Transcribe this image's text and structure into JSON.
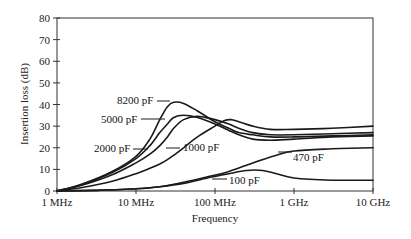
{
  "chart_data": {
    "type": "line",
    "title": "",
    "xlabel": "Frequency",
    "ylabel": "Insertion loss (dB)",
    "xscale": "log",
    "xlim_mhz": [
      1,
      10000
    ],
    "ylim": [
      0,
      80
    ],
    "grid": false,
    "legend": "inline labels with leader lines",
    "x_ticks": [
      {
        "value_mhz": 1,
        "label": "1 MHz"
      },
      {
        "value_mhz": 10,
        "label": "10 MHz"
      },
      {
        "value_mhz": 100,
        "label": "100 MHz"
      },
      {
        "value_mhz": 1000,
        "label": "1 GHz"
      },
      {
        "value_mhz": 10000,
        "label": "10 GHz"
      }
    ],
    "y_ticks": [
      0,
      10,
      20,
      30,
      40,
      50,
      60,
      70,
      80
    ],
    "series": [
      {
        "name": "8200 pF",
        "x_mhz": [
          1,
          2,
          5,
          10,
          15,
          20,
          25,
          30,
          40,
          60,
          100,
          150,
          200,
          300,
          500,
          1000,
          3000,
          10000
        ],
        "values": [
          0,
          3,
          9,
          16,
          24,
          33,
          39,
          41,
          40.5,
          37,
          32,
          29,
          27,
          26,
          25,
          25,
          25.5,
          26
        ]
      },
      {
        "name": "5000 pF",
        "x_mhz": [
          1,
          2,
          5,
          10,
          15,
          20,
          25,
          30,
          40,
          60,
          100,
          150,
          200,
          300,
          500,
          1000,
          3000,
          10000
        ],
        "values": [
          0,
          2.8,
          8.5,
          15,
          21,
          27,
          31,
          34,
          35,
          34,
          31,
          28,
          26,
          24,
          23.5,
          24,
          25,
          25.5
        ]
      },
      {
        "name": "2000 pF",
        "x_mhz": [
          1,
          2,
          5,
          10,
          15,
          20,
          25,
          30,
          40,
          60,
          100,
          150,
          200,
          300,
          500,
          1000,
          3000,
          10000
        ],
        "values": [
          0,
          2.5,
          7.5,
          13,
          17,
          21,
          25,
          29,
          33,
          34.5,
          33,
          31,
          29,
          27,
          26,
          26,
          26.5,
          27
        ]
      },
      {
        "name": "1000 pF",
        "x_mhz": [
          1,
          2,
          5,
          10,
          15,
          20,
          25,
          30,
          40,
          60,
          100,
          130,
          160,
          200,
          300,
          500,
          1000,
          3000,
          10000
        ],
        "values": [
          0,
          1.5,
          4.5,
          8,
          10.5,
          12.5,
          14.5,
          16.5,
          20,
          25,
          30,
          32.5,
          33,
          32,
          30,
          28.5,
          28.5,
          29,
          30
        ]
      },
      {
        "name": "470 pF",
        "x_mhz": [
          1,
          3,
          10,
          20,
          40,
          80,
          150,
          300,
          600,
          1000,
          3000,
          10000
        ],
        "values": [
          0,
          0.3,
          1,
          2,
          4,
          6.5,
          9,
          13,
          16.5,
          18.5,
          19.5,
          20
        ]
      },
      {
        "name": "100 pF",
        "x_mhz": [
          1,
          3,
          10,
          20,
          40,
          80,
          150,
          250,
          400,
          600,
          1000,
          3000,
          10000
        ],
        "values": [
          0,
          0.3,
          1,
          2,
          3.5,
          6,
          8,
          9.5,
          9.5,
          8,
          6,
          5,
          5
        ]
      }
    ]
  },
  "labels": {
    "s8200": "8200 pF",
    "s5000": "5000 pF",
    "s2000": "2000 pF",
    "s1000": "1000 pF",
    "s470": "470 pF",
    "s100": "100 pF",
    "xlabel": "Frequency",
    "ylabel": "Insertion loss (dB)"
  }
}
